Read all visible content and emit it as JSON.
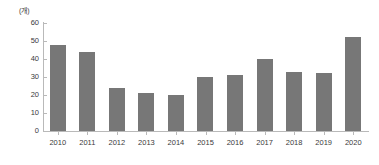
{
  "chart_data": {
    "type": "bar",
    "title": "",
    "subtitle": "",
    "unit_label": "(개)",
    "xlabel": "",
    "ylabel": "",
    "categories": [
      "2010",
      "2011",
      "2012",
      "2013",
      "2014",
      "2015",
      "2016",
      "2017",
      "2018",
      "2019",
      "2020"
    ],
    "values": [
      48,
      44,
      24,
      21,
      20,
      30,
      31,
      40,
      33,
      32,
      52
    ],
    "ylim": [
      0,
      60
    ],
    "ytick_labels": [
      "60",
      "50",
      "40",
      "30",
      "20",
      "10",
      "0"
    ],
    "ytick_values": [
      60,
      50,
      40,
      30,
      20,
      10,
      0
    ],
    "ytick_step": 10,
    "grid": false,
    "legend": null,
    "legend_position": "none",
    "series": [
      {
        "name": "",
        "values": [
          48,
          44,
          24,
          21,
          20,
          30,
          31,
          40,
          33,
          32,
          52
        ]
      }
    ],
    "colors": {
      "bar": "#777777",
      "axis": "#b9b9b9",
      "text": "#3a3a3a",
      "background": "#ffffff"
    }
  }
}
